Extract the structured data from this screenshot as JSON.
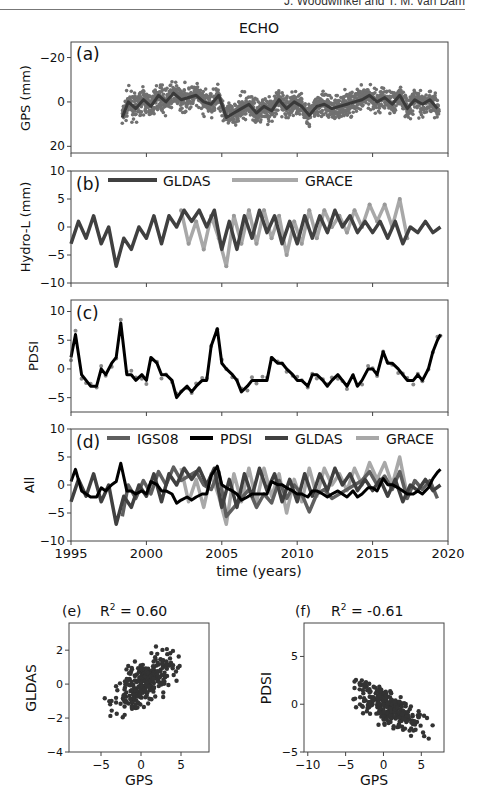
{
  "page": {
    "running_header": "J. Woodwinkel and T. M. van Dam"
  },
  "chart_data": [
    {
      "panel": "(a)",
      "type": "scatter",
      "title": "ECHO",
      "xlabel": "",
      "ylabel": "GPS (mm)",
      "xlim": [
        1995,
        2020
      ],
      "ylim": [
        -23,
        27
      ],
      "yticks": [
        -20,
        0,
        20
      ],
      "series": [
        {
          "name": "GPS daily",
          "kind": "scatter",
          "color": "#707070",
          "spread": [
            -15,
            14
          ]
        },
        {
          "name": "GPS smoothed",
          "kind": "line",
          "color": "#3a3a3a",
          "x": [
            1998.4,
            1998.8,
            1999.3,
            1999.8,
            2000.3,
            2000.8,
            2001.3,
            2001.8,
            2002.3,
            2002.8,
            2003.3,
            2003.8,
            2004.3,
            2004.8,
            2005.3,
            2005.8,
            2006.3,
            2006.8,
            2007.3,
            2007.8,
            2008.3,
            2008.8,
            2009.3,
            2009.8,
            2010.3,
            2010.8,
            2011.3,
            2011.8,
            2012.3,
            2012.8,
            2013.3,
            2013.8,
            2014.3,
            2014.8,
            2015.3,
            2015.8,
            2016.3,
            2016.8,
            2017.3,
            2017.8,
            2018.3,
            2018.8,
            2019.3
          ],
          "y": [
            -7,
            0,
            -3,
            1,
            -2,
            3,
            0,
            4,
            1,
            2,
            3,
            0,
            -1,
            3,
            -7,
            -5,
            -3,
            -1,
            -5,
            -2,
            -4,
            1,
            -3,
            0,
            -2,
            -6,
            -2,
            -1,
            -3,
            -2,
            -1,
            0,
            1,
            3,
            0,
            2,
            -1,
            3,
            -3,
            1,
            -1,
            1,
            -3
          ]
        }
      ]
    },
    {
      "panel": "(b)",
      "type": "line",
      "ylabel": "Hydro-L (mm)",
      "xlim": [
        1995,
        2020
      ],
      "ylim": [
        -10,
        10
      ],
      "yticks": [
        -10,
        -5,
        0,
        5,
        10
      ],
      "legend": [
        "GLDAS",
        "GRACE"
      ],
      "series": [
        {
          "name": "GLDAS",
          "color": "#404040",
          "x": [
            1995,
            1995.5,
            1996,
            1996.5,
            1997,
            1997.5,
            1998,
            1998.5,
            1999,
            1999.5,
            2000,
            2000.5,
            2001,
            2001.5,
            2002,
            2002.5,
            2003,
            2003.5,
            2004,
            2004.5,
            2005,
            2005.5,
            2006,
            2006.5,
            2007,
            2007.5,
            2008,
            2008.5,
            2009,
            2009.5,
            2010,
            2010.5,
            2011,
            2011.5,
            2012,
            2012.5,
            2013,
            2013.5,
            2014,
            2014.5,
            2015,
            2015.5,
            2016,
            2016.5,
            2017,
            2017.5,
            2018,
            2018.5,
            2019,
            2019.5
          ],
          "y": [
            -3,
            1,
            -2,
            2,
            -3,
            0,
            -7,
            -2,
            -4,
            0,
            -2,
            2,
            -3,
            2,
            0,
            3,
            1,
            3,
            0,
            3,
            -4,
            1,
            -4,
            2,
            -2,
            3,
            -1,
            2,
            -3,
            1,
            -3,
            2,
            -2,
            2,
            -1,
            3,
            0,
            2,
            -1,
            1,
            -1,
            1,
            -2,
            1,
            -3,
            0,
            -1,
            1,
            -1,
            0
          ]
        },
        {
          "name": "GRACE",
          "color": "#a8a8a8",
          "x": [
            2002.3,
            2002.8,
            2003.3,
            2003.8,
            2004.3,
            2004.8,
            2005.3,
            2005.8,
            2006.3,
            2006.8,
            2007.3,
            2007.8,
            2008.3,
            2008.8,
            2009.3,
            2009.8,
            2010.3,
            2010.8,
            2011.3,
            2011.8,
            2012.3,
            2012.8,
            2013.3,
            2013.8,
            2014.3,
            2014.8,
            2015.3,
            2015.8,
            2016.3,
            2016.8,
            2017.3
          ],
          "y": [
            3,
            -3,
            1,
            -4,
            2,
            -2,
            -7,
            2,
            -3,
            3,
            -3,
            3,
            -2,
            2,
            -5,
            1,
            -3,
            3,
            -2,
            3,
            0,
            2,
            -1,
            3,
            0,
            4,
            1,
            4,
            0,
            5,
            -2
          ]
        }
      ]
    },
    {
      "panel": "(c)",
      "type": "line",
      "ylabel": "PDSI",
      "xlim": [
        1995,
        2020
      ],
      "ylim": [
        -7.5,
        12
      ],
      "yticks": [
        -5,
        0,
        5,
        10
      ],
      "series": [
        {
          "name": "PDSI",
          "color": "#000000",
          "x": [
            1995,
            1995.3,
            1995.7,
            1996,
            1996.3,
            1996.7,
            1997,
            1997.3,
            1997.7,
            1998,
            1998.3,
            1998.7,
            1999,
            1999.3,
            1999.7,
            2000,
            2000.3,
            2000.7,
            2001,
            2001.3,
            2001.7,
            2002,
            2002.3,
            2002.7,
            2003,
            2003.3,
            2003.7,
            2004,
            2004.3,
            2004.7,
            2005,
            2005.3,
            2005.7,
            2006,
            2006.3,
            2006.7,
            2007,
            2007.3,
            2007.7,
            2008,
            2008.3,
            2008.7,
            2009,
            2009.3,
            2009.7,
            2010,
            2010.3,
            2010.7,
            2011,
            2011.3,
            2011.7,
            2012,
            2012.3,
            2012.7,
            2013,
            2013.3,
            2013.7,
            2014,
            2014.3,
            2014.7,
            2015,
            2015.3,
            2015.7,
            2016,
            2016.3,
            2016.7,
            2017,
            2017.3,
            2017.7,
            2018,
            2018.3,
            2018.7,
            2019,
            2019.3,
            2019.5
          ],
          "y": [
            2,
            6,
            -1,
            -2,
            -3,
            -3,
            0,
            -1,
            1,
            2,
            8,
            -1,
            -1,
            -2,
            -1,
            -2,
            2,
            1,
            -1,
            -1,
            -2,
            -5,
            -4,
            -3,
            -4,
            -3,
            -2,
            -2,
            4,
            7,
            1,
            0,
            -1,
            -2,
            -4,
            -3,
            -2,
            -2,
            -2,
            -2,
            2,
            1,
            1,
            0,
            -1,
            -2,
            -2,
            -3,
            -1,
            -1,
            -2,
            -3,
            -2,
            -1,
            -2,
            -3,
            -1,
            -3,
            -2,
            0,
            0,
            -1,
            3,
            1,
            1,
            0,
            -1,
            -2,
            -2,
            -1,
            -2,
            0,
            3,
            5,
            6
          ]
        }
      ]
    },
    {
      "panel": "(d)",
      "type": "line",
      "ylabel": "All",
      "xlabel": "time (years)",
      "xlim": [
        1995,
        2020
      ],
      "xticks": [
        1995,
        2000,
        2005,
        2010,
        2015,
        2020
      ],
      "ylim": [
        -10,
        10
      ],
      "yticks": [
        -10,
        -5,
        0,
        5,
        10
      ],
      "legend": [
        "IGS08",
        "PDSI",
        "GLDAS",
        "GRACE"
      ],
      "series": [
        {
          "name": "IGS08",
          "color": "#5f5f5f"
        },
        {
          "name": "PDSI",
          "color": "#000000"
        },
        {
          "name": "GLDAS",
          "color": "#404040"
        },
        {
          "name": "GRACE",
          "color": "#a8a8a8"
        }
      ]
    },
    {
      "panel": "(e)",
      "type": "scatter",
      "title": "R² = 0.60",
      "r2_label": "R",
      "r2_value": "= 0.60",
      "xlabel": "GPS",
      "ylabel": "GLDAS",
      "xlim": [
        -9,
        8.5
      ],
      "ylim": [
        -4,
        3.6
      ],
      "xticks": [
        -5,
        0,
        5
      ],
      "yticks": [
        -4,
        -2,
        0,
        2
      ],
      "r2": 0.6
    },
    {
      "panel": "(f)",
      "type": "scatter",
      "title": "R² = -0.61",
      "r2_label": "R",
      "r2_value": "= -0.61",
      "xlabel": "GPS",
      "ylabel": "PDSI",
      "xlim": [
        -10.5,
        8
      ],
      "ylim": [
        -5,
        8.5
      ],
      "xticks": [
        -10,
        -5,
        0,
        5
      ],
      "yticks": [
        -5,
        0,
        5
      ],
      "r2": -0.61
    }
  ],
  "labels": {
    "title": "ECHO",
    "panel_a": "(a)",
    "panel_b": "(b)",
    "panel_c": "(c)",
    "panel_d": "(d)",
    "panel_e": "(e)",
    "panel_f": "(f)",
    "ylabel_a": "GPS (mm)",
    "ylabel_b": "Hydro-L (mm)",
    "ylabel_c": "PDSI",
    "ylabel_d": "All",
    "xlabel_d": "time (years)",
    "legend_b": [
      "GLDAS",
      "GRACE"
    ],
    "legend_d": [
      "IGS08",
      "PDSI",
      "GLDAS",
      "GRACE"
    ],
    "e_r2": "R",
    "e_r2_sup": "2",
    "e_r2_val": " = 0.60",
    "f_r2": "R",
    "f_r2_sup": "2",
    "f_r2_val": " = -0.61",
    "e_xlabel": "GPS",
    "e_ylabel": "GLDAS",
    "f_xlabel": "GPS",
    "f_ylabel": "PDSI",
    "ticks_a_y": [
      "20",
      "0",
      "−20"
    ],
    "ticks_b_y": [
      "10",
      "5",
      "0",
      "−5",
      "−10"
    ],
    "ticks_c_y": [
      "10",
      "5",
      "0",
      "−5"
    ],
    "ticks_d_y": [
      "10",
      "5",
      "0",
      "−5",
      "−10"
    ],
    "ticks_x": [
      "1995",
      "2000",
      "2005",
      "2010",
      "2015",
      "2020"
    ],
    "ticks_e_x": [
      "−5",
      "0",
      "5"
    ],
    "ticks_e_y": [
      "2",
      "0",
      "−2",
      "−4"
    ],
    "ticks_f_x": [
      "−10",
      "−5",
      "0",
      "5"
    ],
    "ticks_f_y": [
      "5",
      "0",
      "−5"
    ]
  },
  "colors": {
    "gps_scatter": "#707070",
    "gps_line": "#3a3a3a",
    "gldas": "#404040",
    "grace": "#a8a8a8",
    "igs08": "#5f5f5f",
    "pdsi": "#000000",
    "axis": "#444444"
  }
}
